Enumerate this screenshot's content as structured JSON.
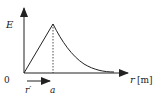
{
  "diagram": {
    "y_axis_label": "E",
    "x_axis_label_var": "r",
    "x_axis_label_unit": "[m]",
    "origin_label": "0",
    "peak_label": "a",
    "arrow_label": "r′",
    "colors": {
      "stroke": "#222222",
      "background": "#ffffff"
    }
  }
}
